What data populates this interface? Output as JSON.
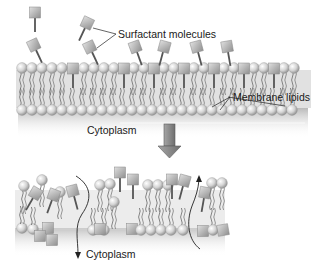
{
  "labels": {
    "surfactant": "Surfactant  molecules",
    "membrane_lipids": "Membrane lipids",
    "cytoplasm_top": "Cytoplasm",
    "cytoplasm_bottom": "Cytoplasm"
  },
  "colors": {
    "head": "#d0d0d0",
    "head_shade": "#8c8c8c",
    "tail": "#7a7a7a",
    "surfactant_head": "#b5b5b5",
    "surfactant_stem": "#555555",
    "arrow": "#8a8a8a",
    "arrow_edge": "#555555",
    "cytoplasm_shade": "#bdbdbd"
  },
  "panels": [
    {
      "name": "intact-membrane",
      "description": "Lipid bilayer with surfactant molecules inserting into outer leaflet"
    },
    {
      "name": "disrupted-membrane",
      "description": "Membrane disrupted by surfactant forming pores; contents leak"
    }
  ]
}
